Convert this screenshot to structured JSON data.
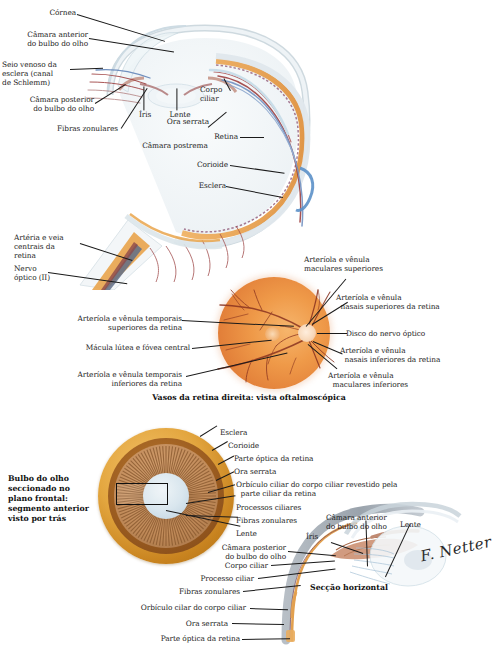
{
  "plate": {
    "title": "Anatomia do bulbo do olho",
    "language": "pt-BR"
  },
  "colors": {
    "sclera": "#e8eef1",
    "choroid": "#8e4b6e",
    "retina_orange": "#e89a4e",
    "artery_red": "#9c3b3b",
    "vein_blue": "#5b7fb5",
    "globe_gold": "#d9a43c",
    "ciliary_brown": "#9c6b3f",
    "lens_blue": "#d2e2ec",
    "label_text": "#1d1d1d",
    "leader_line": "#1a1a1a"
  },
  "figures": [
    {
      "id": "anterior-horizontal-section",
      "caption": "",
      "labels_left": [
        {
          "id": "cornea",
          "text": "Córnea"
        },
        {
          "id": "anterior-chamber",
          "text": "Câmara anterior\ndo bulbo do olho"
        },
        {
          "id": "schlemm-canal",
          "text": "Seio venoso da\nesclera (canal\nde Schlemm)"
        },
        {
          "id": "posterior-chamber",
          "text": "Câmara posterior\ndo bulbo do olho"
        },
        {
          "id": "zonular-fibers",
          "text": "Fibras zonulares"
        },
        {
          "id": "central-artery-vein",
          "text": "Artéria e veia\ncentrais da\nretina"
        },
        {
          "id": "optic-nerve",
          "text": "Nervo\nóptico (II)"
        }
      ],
      "labels_inner": [
        {
          "id": "iris",
          "text": "Íris"
        },
        {
          "id": "lens",
          "text": "Lente"
        },
        {
          "id": "postremal-chamber",
          "text": "Câmara postrema"
        }
      ],
      "labels_right": [
        {
          "id": "ciliary-body",
          "text": "Corpo\nciliar"
        },
        {
          "id": "ora-serrata",
          "text": "Ora serrata"
        },
        {
          "id": "retina",
          "text": "Retina"
        },
        {
          "id": "choroid",
          "text": "Corioide"
        },
        {
          "id": "sclera",
          "text": "Esclera"
        }
      ]
    },
    {
      "id": "fundus-ophthalmoscopic-view",
      "caption": "Vasos da retina direita: vista oftalmoscópica",
      "labels_left": [
        {
          "id": "superior-temporal-vessels",
          "text": "Arteríola e vênula temporais\nsuperiores da retina"
        },
        {
          "id": "macula-fovea",
          "text": "Mácula lútea e fóvea central"
        },
        {
          "id": "inferior-temporal-vessels",
          "text": "Arteríola e vênula temporais\ninferiores da retina"
        }
      ],
      "labels_right": [
        {
          "id": "superior-macular-vessels",
          "text": "Arteríola e vênula\nmaculares superiores"
        },
        {
          "id": "superior-nasal-vessels",
          "text": "Arteríola e vênula\n  nasais superiores da retina"
        },
        {
          "id": "optic-disc",
          "text": "Disco do nervo óptico"
        },
        {
          "id": "inferior-nasal-vessels",
          "text": "Arteríola e vênula\n  nasais inferiores da retina"
        },
        {
          "id": "inferior-macular-vessels",
          "text": "Arteríola e vênula\n  maculares inferiores"
        }
      ]
    },
    {
      "id": "frontal-section-anterior-segment",
      "caption": "Bulbo do olho\nseccionado no\nplano frontal:\nsegmento anterior\nvisto por trás",
      "labels_right": [
        {
          "id": "sclera",
          "text": "Esclera"
        },
        {
          "id": "choroid",
          "text": "Corioide"
        },
        {
          "id": "optic-part-retina",
          "text": "Parte óptica da retina"
        },
        {
          "id": "ora-serrata",
          "text": "Ora serrata"
        },
        {
          "id": "ciliary-orbiculus",
          "text": "Orbículo ciliar do corpo ciliar revestido pela\n  parte ciliar da retina"
        },
        {
          "id": "ciliary-processes",
          "text": "Processos ciliares"
        },
        {
          "id": "zonular-fibers",
          "text": "Fibras zonulares"
        },
        {
          "id": "lens",
          "text": "Lente"
        }
      ]
    },
    {
      "id": "horizontal-section-detail",
      "caption": "Secção horizontal",
      "labels_left": [
        {
          "id": "posterior-chamber",
          "text": "Câmara posterior\ndo bulbo do olho"
        },
        {
          "id": "ciliary-body",
          "text": "Corpo ciliar"
        },
        {
          "id": "ciliary-process",
          "text": "Processo ciliar"
        },
        {
          "id": "zonular-fibers",
          "text": "Fibras zonulares"
        },
        {
          "id": "ciliary-orbiculus",
          "text": "Orbículo cilar do corpo ciliar"
        },
        {
          "id": "ora-serrata",
          "text": "Ora serrata"
        },
        {
          "id": "optic-part-retina",
          "text": "Parte óptica da retina"
        }
      ],
      "labels_top": [
        {
          "id": "anterior-chamber",
          "text": "Câmara anterior\ndo bulbo do olho"
        },
        {
          "id": "lens",
          "text": "Lente"
        },
        {
          "id": "iris",
          "text": "Íris"
        }
      ]
    }
  ],
  "signature": {
    "name": "F. Netter",
    "initials": "F. Netter"
  }
}
